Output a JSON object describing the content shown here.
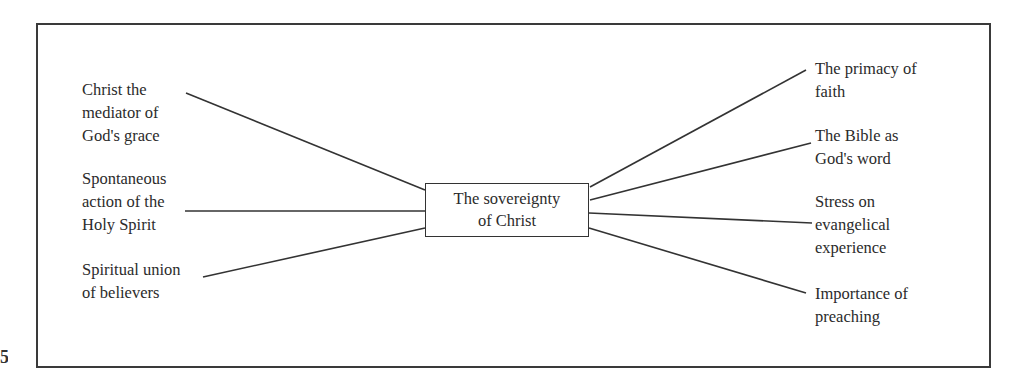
{
  "page": {
    "number_fragment": "5"
  },
  "diagram": {
    "center": {
      "lines": [
        "The sovereignty",
        "of Christ"
      ]
    },
    "left_nodes": [
      {
        "lines": [
          "Christ the",
          "mediator of",
          "God's grace"
        ]
      },
      {
        "lines": [
          "Spontaneous",
          "action of the",
          "Holy Spirit"
        ]
      },
      {
        "lines": [
          "Spiritual union",
          "of believers"
        ]
      }
    ],
    "right_nodes": [
      {
        "lines": [
          "The primacy of",
          "faith"
        ]
      },
      {
        "lines": [
          "The Bible as",
          "God's word"
        ]
      },
      {
        "lines": [
          "Stress on",
          "evangelical",
          "experience"
        ]
      },
      {
        "lines": [
          "Importance of",
          "preaching"
        ]
      }
    ],
    "colors": {
      "line": "#333333",
      "border": "#3a3a3a",
      "text": "#2b2b2b"
    }
  }
}
